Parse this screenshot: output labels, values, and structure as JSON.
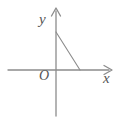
{
  "figure": {
    "kind": "cartesian-coordinate-diagram",
    "background_color": "#ffffff",
    "axis_color": "#8c8c8c",
    "segment_color": "#8c8c8c",
    "label_color": "#555555",
    "labels": {
      "y_axis": "y",
      "x_axis": "x",
      "origin": "O"
    }
  },
  "chart_data": {
    "type": "line",
    "title": "",
    "subtitle": "",
    "xlabel": "x",
    "ylabel": "y",
    "grid": false,
    "legend": null,
    "axes": {
      "origin_label": "O",
      "origin_px": [
        56,
        70
      ],
      "x_axis": {
        "label": "x",
        "orientation": "horizontal",
        "start_px": [
          8,
          70
        ],
        "end_px": [
          112,
          70
        ],
        "arrow_at": "end",
        "ticks": [],
        "tick_labels": []
      },
      "y_axis": {
        "label": "y",
        "orientation": "vertical",
        "start_px": [
          56,
          116
        ],
        "end_px": [
          56,
          8
        ],
        "arrow_at": "end",
        "ticks": [],
        "tick_labels": []
      }
    },
    "series": [
      {
        "name": "segment",
        "description": "line segment from a point on the positive y-axis down to a point on the positive x-axis",
        "points_px": [
          [
            56,
            32
          ],
          [
            80,
            70
          ]
        ],
        "x": [
          0,
          1
        ],
        "values": [
          1,
          0
        ]
      }
    ],
    "annotations": [
      {
        "text": "y",
        "px": [
          44,
          19
        ]
      },
      {
        "text": "x",
        "px": [
          108,
          78
        ]
      },
      {
        "text": "O",
        "px": [
          44,
          75
        ]
      }
    ]
  }
}
